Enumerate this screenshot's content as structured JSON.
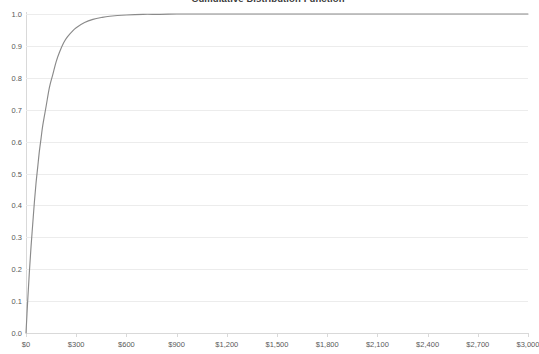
{
  "chart_data": {
    "type": "line",
    "title": "Cumulative Distribution Function",
    "xlabel": "",
    "ylabel": "",
    "xlim": [
      0,
      3000
    ],
    "ylim": [
      0,
      1.0
    ],
    "grid": true,
    "legend": false,
    "x_tick_labels": [
      "$0",
      "$300",
      "$600",
      "$900",
      "$1,200",
      "$1,500",
      "$1,800",
      "$2,100",
      "$2,400",
      "$2,700",
      "$3,000"
    ],
    "x_ticks": [
      0,
      300,
      600,
      900,
      1200,
      1500,
      1800,
      2100,
      2400,
      2700,
      3000
    ],
    "y_tick_labels": [
      "0.0",
      "0.1",
      "0.2",
      "0.3",
      "0.4",
      "0.5",
      "0.6",
      "0.7",
      "0.8",
      "0.9",
      "1.0"
    ],
    "y_ticks": [
      0.0,
      0.1,
      0.2,
      0.3,
      0.4,
      0.5,
      0.6,
      0.7,
      0.8,
      0.9,
      1.0
    ],
    "series": [
      {
        "name": "Cumulative Distribution Function",
        "color": "#8a8a8a",
        "x": [
          0,
          10,
          20,
          30,
          40,
          50,
          60,
          70,
          80,
          90,
          100,
          120,
          140,
          160,
          180,
          200,
          225,
          250,
          275,
          300,
          350,
          400,
          450,
          500,
          600,
          700,
          800,
          900,
          1000,
          1200,
          1400,
          1600,
          1800,
          2000,
          2200,
          2400,
          2600,
          2800,
          3000
        ],
        "y": [
          0.0,
          0.1,
          0.19,
          0.27,
          0.34,
          0.41,
          0.47,
          0.52,
          0.57,
          0.61,
          0.65,
          0.71,
          0.77,
          0.81,
          0.85,
          0.88,
          0.91,
          0.93,
          0.945,
          0.957,
          0.973,
          0.983,
          0.989,
          0.993,
          0.997,
          0.999,
          0.999,
          1.0,
          1.0,
          1.0,
          1.0,
          1.0,
          1.0,
          1.0,
          1.0,
          1.0,
          1.0,
          1.0,
          1.0
        ]
      }
    ]
  },
  "colors": {
    "curve": "#8a8a8a",
    "gridline": "#ececec",
    "axis": "#d9d9d9",
    "tick_text": "#595959",
    "title_text": "#3a3a3a",
    "background": "#ffffff"
  }
}
